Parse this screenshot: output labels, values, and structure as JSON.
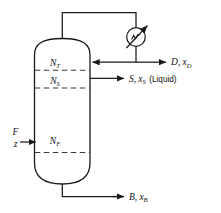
{
  "diagram": {
    "type": "process-flow-diagram",
    "colors": {
      "line": "#1a1a1a",
      "tray": "#3b3b3b",
      "background": "#ffffff",
      "text": "#111111"
    },
    "vessel": {
      "name": "distillation-column",
      "stages": [
        {
          "id": "top",
          "label": "N",
          "subscript": "T"
        },
        {
          "id": "side",
          "label": "N",
          "subscript": "S"
        },
        {
          "id": "feed",
          "label": "N",
          "subscript": "F"
        }
      ]
    },
    "equipment": [
      {
        "id": "condenser",
        "icon": "condenser-circle-arrow-icon",
        "label": ""
      }
    ],
    "streams": [
      {
        "id": "feed",
        "name": "feed-stream",
        "labels": [
          {
            "text": "F",
            "style": "italic"
          },
          {
            "text": "z",
            "style": "italic"
          }
        ],
        "direction": "into-column-left"
      },
      {
        "id": "distillate",
        "name": "distillate-stream",
        "main": "D",
        "separator": ",",
        "composition": "x",
        "composition_subscript": "D",
        "note": "",
        "direction": "out-right"
      },
      {
        "id": "sidestream",
        "name": "side-stream",
        "main": "S",
        "separator": ",",
        "composition": "x",
        "composition_subscript": "S",
        "note": "(Liquid)",
        "direction": "out-right"
      },
      {
        "id": "bottoms",
        "name": "bottoms-stream",
        "main": "B",
        "separator": ",",
        "composition": "x",
        "composition_subscript": "B",
        "note": "",
        "direction": "out-right"
      },
      {
        "id": "reflux",
        "name": "reflux-stream",
        "main": "",
        "direction": "into-column-right"
      },
      {
        "id": "overhead-vapor",
        "name": "overhead-vapor-line",
        "main": "",
        "direction": "up-to-condenser"
      }
    ]
  }
}
